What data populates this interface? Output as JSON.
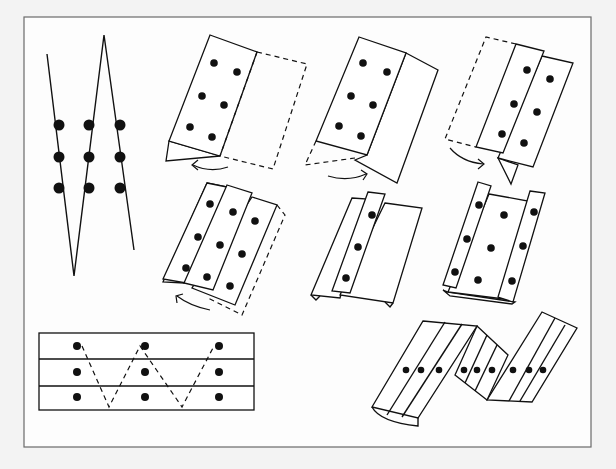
{
  "figure": {
    "colors": {
      "ink": "#111111",
      "frame": "#6a6a6a",
      "paper": "#ffffff",
      "background": "#f3f3f3"
    },
    "frame": {
      "x": 24,
      "y": 17,
      "width": 567,
      "height": 430
    },
    "dot_grid": {
      "rows": 3,
      "columns": 3,
      "total_dots": 9
    },
    "panels": [
      {
        "id": "zigzag-profile",
        "label": "Side view: zigzag fold line with 3 columns of dots",
        "dots": 9
      },
      {
        "id": "step-1",
        "label": "Fold left flap under (dashed = hidden part)",
        "dots": 6,
        "arrow": "left"
      },
      {
        "id": "step-2",
        "label": "Flip and fold",
        "dots": 6,
        "arrow": "right"
      },
      {
        "id": "step-3",
        "label": "Fold dashed flap behind",
        "dots": 6,
        "arrow": "right"
      },
      {
        "id": "step-4",
        "label": "Three strips, fold dashed flap",
        "dots": 9,
        "arrow": "left"
      },
      {
        "id": "step-5",
        "label": "Folded strip view",
        "dots": 3
      },
      {
        "id": "step-6",
        "label": "Folded with three columns visible",
        "dots": 9
      },
      {
        "id": "flat-layout",
        "label": "Flat sheet with three rows and zigzag fold path",
        "dots": 9
      },
      {
        "id": "final-result",
        "label": "Final zigzag accordion fold",
        "dots": 9
      }
    ]
  }
}
